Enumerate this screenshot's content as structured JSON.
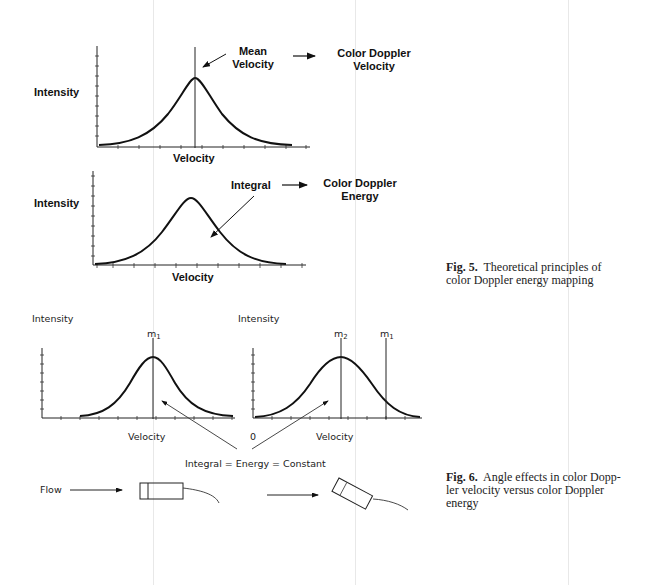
{
  "fig5": {
    "top_chart": {
      "ylabel": "Intensity",
      "xlabel": "Velocity",
      "annotation": "Mean\nVelocity",
      "annotation_line1": "Mean",
      "annotation_line2": "Velocity",
      "result_line1": "Color Doppler",
      "result_line2": "Velocity"
    },
    "bottom_chart": {
      "ylabel": "Intensity",
      "xlabel": "Velocity",
      "annotation": "Integral",
      "result_line1": "Color Doppler",
      "result_line2": "Energy"
    },
    "caption_label": "Fig. 5.",
    "caption_line1": "Theoretical principles of",
    "caption_line2": "color Doppler energy mapping"
  },
  "fig6": {
    "left_chart": {
      "ylabel": "Intensity",
      "xlabel": "Velocity",
      "marker": "m",
      "marker_sub": "1"
    },
    "right_chart": {
      "ylabel": "Intensity",
      "xlabel": "Velocity",
      "origin": "0",
      "marker_a": "m",
      "marker_a_sub": "2",
      "marker_b": "m",
      "marker_b_sub": "1"
    },
    "equation": "Integral = Energy = Constant",
    "flow_label": "Flow",
    "caption_label": "Fig. 6.",
    "caption_line1": "Angle effects in color Dopp-",
    "caption_line2": "ler velocity versus color Doppler",
    "caption_line3": "energy"
  }
}
